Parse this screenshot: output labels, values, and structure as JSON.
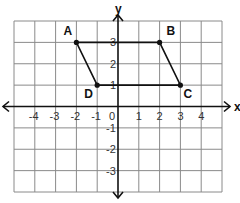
{
  "diagram": {
    "type": "coordinate-plane",
    "x_range": [
      -5,
      5
    ],
    "y_range": [
      -4,
      4
    ],
    "grid_px": {
      "left": 14,
      "right": 222,
      "top": 21,
      "bottom": 192
    },
    "axis_labels": {
      "x": "x",
      "y": "y"
    },
    "x_ticks": [
      {
        "value": -4,
        "label": "-4"
      },
      {
        "value": -3,
        "label": "-3"
      },
      {
        "value": -2,
        "label": "-2"
      },
      {
        "value": -1,
        "label": "-1"
      },
      {
        "value": 0,
        "label": "0"
      },
      {
        "value": 1,
        "label": "1"
      },
      {
        "value": 2,
        "label": "2"
      },
      {
        "value": 3,
        "label": "3"
      },
      {
        "value": 4,
        "label": "4"
      }
    ],
    "y_ticks": [
      {
        "value": 3,
        "label": "3"
      },
      {
        "value": 2,
        "label": "2"
      },
      {
        "value": 1,
        "label": "1"
      },
      {
        "value": -1,
        "label": "-1"
      },
      {
        "value": -2,
        "label": "-2"
      },
      {
        "value": -3,
        "label": "-3"
      }
    ],
    "points": [
      {
        "name": "A",
        "x": -2,
        "y": 3,
        "label_dx": -13,
        "label_dy": -7
      },
      {
        "name": "B",
        "x": 2,
        "y": 3,
        "label_dx": 7,
        "label_dy": -7
      },
      {
        "name": "C",
        "x": 3,
        "y": 1,
        "label_dx": 3,
        "label_dy": 13
      },
      {
        "name": "D",
        "x": -1,
        "y": 1,
        "label_dx": -13,
        "label_dy": 13
      }
    ],
    "polygon": [
      "A",
      "B",
      "C",
      "D"
    ],
    "colors": {
      "grid": "#8a8a8a",
      "axis": "#111111",
      "shape": "#111111"
    }
  }
}
